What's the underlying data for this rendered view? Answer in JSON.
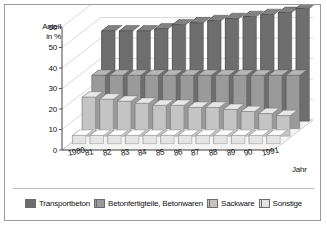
{
  "chart_data": {
    "type": "bar",
    "render": "3d-stacked-rows",
    "title": "",
    "subtitle": "",
    "xlabel": "Jahr",
    "ylabel": "Anteil in %",
    "ylabel_line1": "Anteil",
    "ylabel_line2": "in %",
    "ylim": [
      0,
      60
    ],
    "yticks": [
      0,
      10,
      20,
      30,
      40,
      50,
      60
    ],
    "grid": true,
    "legend_position": "bottom",
    "categories": [
      "1980",
      "81",
      "82",
      "83",
      "84",
      "85",
      "86",
      "87",
      "88",
      "89",
      "90",
      "1991"
    ],
    "series": [
      {
        "name": "Transportbeton",
        "color": "#6e6e6e",
        "values": [
          44,
          44,
          44,
          45,
          47,
          48,
          49,
          50,
          51,
          52,
          53,
          55
        ]
      },
      {
        "name": "Betonfertigteile, Betonwaren",
        "color": "#9a9a9a",
        "values": [
          26,
          26,
          26,
          26,
          26,
          26,
          26,
          26,
          26,
          26,
          26,
          26
        ]
      },
      {
        "name": "Sackware",
        "color": "#c4c4c4",
        "values": [
          19,
          18,
          17,
          16,
          15,
          15,
          14,
          14,
          13,
          12,
          11,
          10
        ]
      },
      {
        "name": "Sonstige",
        "color": "#e4e4e4",
        "values": [
          4,
          4,
          4,
          4,
          4,
          4,
          4,
          4,
          4,
          4,
          4,
          4
        ]
      }
    ]
  },
  "axes": {
    "y_label_line1": "Anteil",
    "y_label_line2": "in %",
    "x_label": "Jahr",
    "y_ticks": [
      "60",
      "50",
      "40",
      "30",
      "20",
      "10",
      "0"
    ],
    "x_ticks": [
      "1980",
      "81",
      "82",
      "83",
      "84",
      "85",
      "86",
      "87",
      "88",
      "89",
      "90",
      "1991"
    ]
  },
  "legend": {
    "items": [
      {
        "label": "Transportbeton",
        "color": "#6e6e6e"
      },
      {
        "label": "Betonfertigteile, Betonwaren",
        "color": "#9a9a9a"
      },
      {
        "label": "Sackware",
        "color": "#c4c4c4"
      },
      {
        "label": "Sonstige",
        "color": "#e4e4e4"
      }
    ]
  },
  "colors": {
    "frame_border": "#9a9a9a",
    "background": "#ffffff",
    "grid": "#c8c8c8",
    "axis": "#555555",
    "text": "#111111"
  }
}
